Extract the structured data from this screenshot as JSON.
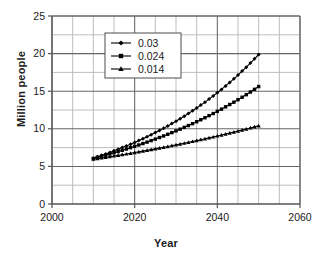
{
  "chart_data": {
    "type": "line",
    "title": "",
    "xlabel": "Year",
    "ylabel": "Million people",
    "xlim": [
      2000,
      2060
    ],
    "ylim": [
      0,
      25
    ],
    "xticks": [
      2000,
      2020,
      2040,
      2060
    ],
    "yticks": [
      0,
      5,
      10,
      15,
      20,
      25
    ],
    "xtick_labels": [
      "2000",
      "2020",
      "2040",
      "2060"
    ],
    "ytick_labels": [
      "0",
      "5",
      "10",
      "15",
      "20",
      "25"
    ],
    "x_minor_step": 5,
    "y_minor_step": 2.5,
    "grid": true,
    "legend_position": "upper-left-inside",
    "series": [
      {
        "name": "0.03",
        "marker": "diamond",
        "color": "#000000",
        "x": [
          2010,
          2011,
          2012,
          2013,
          2014,
          2015,
          2016,
          2017,
          2018,
          2019,
          2020,
          2021,
          2022,
          2023,
          2024,
          2025,
          2026,
          2027,
          2028,
          2029,
          2030,
          2031,
          2032,
          2033,
          2034,
          2035,
          2036,
          2037,
          2038,
          2039,
          2040,
          2041,
          2042,
          2043,
          2044,
          2045,
          2046,
          2047,
          2048,
          2049,
          2050
        ],
        "values": [
          6.1,
          6.28,
          6.47,
          6.66,
          6.86,
          7.07,
          7.28,
          7.5,
          7.72,
          7.95,
          8.19,
          8.44,
          8.69,
          8.95,
          9.22,
          9.5,
          9.78,
          10.07,
          10.38,
          10.69,
          11.01,
          11.34,
          11.68,
          12.03,
          12.39,
          12.76,
          13.15,
          13.54,
          13.95,
          14.37,
          14.8,
          15.24,
          15.7,
          16.17,
          16.65,
          17.15,
          17.67,
          18.2,
          18.74,
          19.3,
          19.88
        ]
      },
      {
        "name": "0.024",
        "marker": "square",
        "color": "#000000",
        "x": [
          2010,
          2011,
          2012,
          2013,
          2014,
          2015,
          2016,
          2017,
          2018,
          2019,
          2020,
          2021,
          2022,
          2023,
          2024,
          2025,
          2026,
          2027,
          2028,
          2029,
          2030,
          2031,
          2032,
          2033,
          2034,
          2035,
          2036,
          2037,
          2038,
          2039,
          2040,
          2041,
          2042,
          2043,
          2044,
          2045,
          2046,
          2047,
          2048,
          2049,
          2050
        ],
        "values": [
          6.05,
          6.2,
          6.34,
          6.49,
          6.65,
          6.81,
          6.97,
          7.14,
          7.31,
          7.49,
          7.67,
          7.85,
          8.04,
          8.23,
          8.43,
          8.63,
          8.84,
          9.05,
          9.27,
          9.49,
          9.72,
          9.95,
          10.19,
          10.43,
          10.68,
          10.94,
          11.2,
          11.47,
          11.75,
          12.03,
          12.32,
          12.61,
          12.92,
          13.23,
          13.54,
          13.87,
          14.2,
          14.54,
          14.89,
          15.25,
          15.62
        ]
      },
      {
        "name": "0.014",
        "marker": "triangle",
        "color": "#000000",
        "x": [
          2010,
          2011,
          2012,
          2013,
          2014,
          2015,
          2016,
          2017,
          2018,
          2019,
          2020,
          2021,
          2022,
          2023,
          2024,
          2025,
          2026,
          2027,
          2028,
          2029,
          2030,
          2031,
          2032,
          2033,
          2034,
          2035,
          2036,
          2037,
          2038,
          2039,
          2040,
          2041,
          2042,
          2043,
          2044,
          2045,
          2046,
          2047,
          2048,
          2049,
          2050
        ],
        "values": [
          5.95,
          6.03,
          6.12,
          6.2,
          6.29,
          6.38,
          6.47,
          6.56,
          6.65,
          6.74,
          6.84,
          6.93,
          7.03,
          7.13,
          7.23,
          7.33,
          7.43,
          7.54,
          7.64,
          7.75,
          7.86,
          7.97,
          8.08,
          8.19,
          8.31,
          8.43,
          8.55,
          8.67,
          8.79,
          8.91,
          9.04,
          9.17,
          9.3,
          9.43,
          9.56,
          9.7,
          9.83,
          9.97,
          10.11,
          10.26,
          10.4
        ]
      }
    ],
    "legend_entries": [
      {
        "label": "0.03",
        "marker": "diamond"
      },
      {
        "label": "0.024",
        "marker": "square"
      },
      {
        "label": "0.014",
        "marker": "triangle"
      }
    ],
    "colors": {
      "line": "#000000",
      "grid_major": "#666666",
      "grid_minor": "#b5b5b5",
      "axis": "#555555",
      "text": "#1a1a1a",
      "background": "#ffffff"
    }
  }
}
